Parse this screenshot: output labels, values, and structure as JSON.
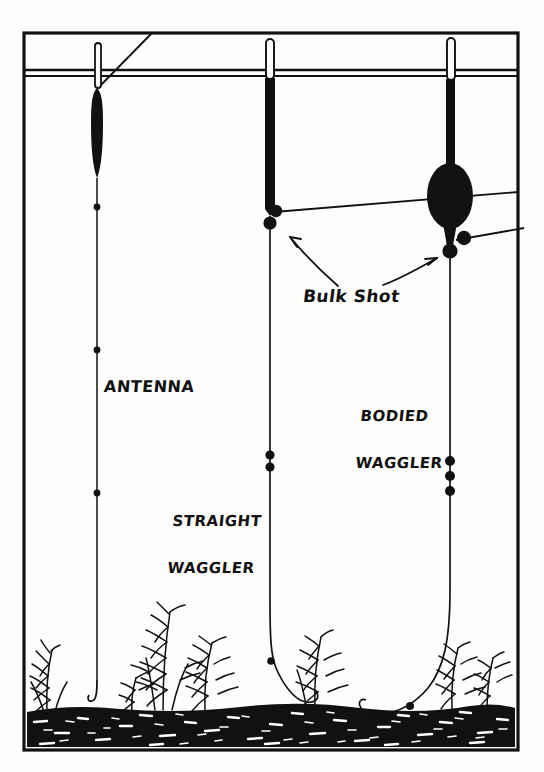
{
  "figure": {
    "style": "black and white line illustration",
    "labels": {
      "antenna": "ANTENNA",
      "straight_waggler_line1": "STRAIGHT",
      "straight_waggler_line2": "WAGGLER",
      "bodied_waggler_line1": "BODIED",
      "bodied_waggler_line2": "WAGGLER",
      "bulk_shot": "Bulk Shot"
    },
    "colors": {
      "ink": "#111111",
      "paper": "#fdfdfb",
      "bed": "#111111",
      "speckle": "#ffffff"
    },
    "elements": {
      "frame": "rectangular border",
      "waterline": "double horizontal line",
      "floats": [
        {
          "name": "antenna-float",
          "x": 97,
          "tip_top": 40,
          "body_top": 88,
          "body_bottom": 178,
          "body_width": 9,
          "shape": "slim straight"
        },
        {
          "name": "straight-waggler-float",
          "x": 270,
          "tip_top": 36,
          "body_top": 78,
          "body_bottom": 207,
          "body_width": 10,
          "shape": "straight stem"
        },
        {
          "name": "bodied-waggler-float",
          "x": 450,
          "tip_top": 36,
          "body_top": 78,
          "body_bottom": 245,
          "body_width": 9,
          "shape": "bulbous body",
          "bulb_cy": 196,
          "bulb_rx": 22,
          "bulb_ry": 31
        }
      ],
      "shot": {
        "antenna_rig_spread": [
          207,
          350,
          493
        ],
        "straight_waggler_bulk": [
          211,
          222
        ],
        "straight_waggler_droppers": [
          455,
          466,
          661
        ],
        "bodied_waggler_bulk": [
          237,
          249
        ],
        "bodied_waggler_droppers": [
          460,
          475,
          490,
          706
        ]
      },
      "weeds_count": 7,
      "arrows": 2,
      "hooks": 3
    }
  }
}
